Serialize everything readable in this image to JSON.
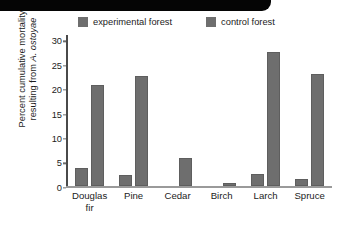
{
  "chart_data": {
    "type": "bar",
    "title": "",
    "subtitle": "",
    "xlabel": "",
    "ylabel": "Percent cumulative mortality resulting from A. ostoyae",
    "ylabel_line1": "Percent cumulative mortality",
    "ylabel_line2_prefix": "resulting from ",
    "ylabel_line2_species": "A. ostoyae",
    "categories": [
      "Douglas fir",
      "Pine",
      "Cedar",
      "Birch",
      "Larch",
      "Spruce"
    ],
    "category_lines": [
      [
        "Douglas",
        "fir"
      ],
      [
        "Pine",
        ""
      ],
      [
        "Cedar",
        ""
      ],
      [
        "Birch",
        ""
      ],
      [
        "Larch",
        ""
      ],
      [
        "Spruce",
        ""
      ]
    ],
    "series": [
      {
        "name": "experimental forest",
        "color": "#6e6e6e",
        "values": [
          3.8,
          2.3,
          0,
          0,
          2.5,
          1.5
        ]
      },
      {
        "name": "control forest",
        "color": "#6e6e6e",
        "values": [
          20.9,
          22.7,
          5.8,
          0.8,
          27.6,
          23.0
        ]
      }
    ],
    "ylim": [
      0,
      31
    ],
    "yticks": [
      0,
      5,
      10,
      15,
      20,
      25,
      30
    ],
    "ytick_labels": [
      "0",
      "5",
      "10",
      "15",
      "20",
      "25",
      "30"
    ],
    "grid": false,
    "legend_position": "top"
  },
  "legend": {
    "entries": [
      {
        "label": "experimental forest",
        "swatch_color": "#6e6e6e"
      },
      {
        "label": "control forest",
        "swatch_color": "#6e6e6e"
      }
    ]
  },
  "decoration": {
    "band_color": "#050505"
  }
}
